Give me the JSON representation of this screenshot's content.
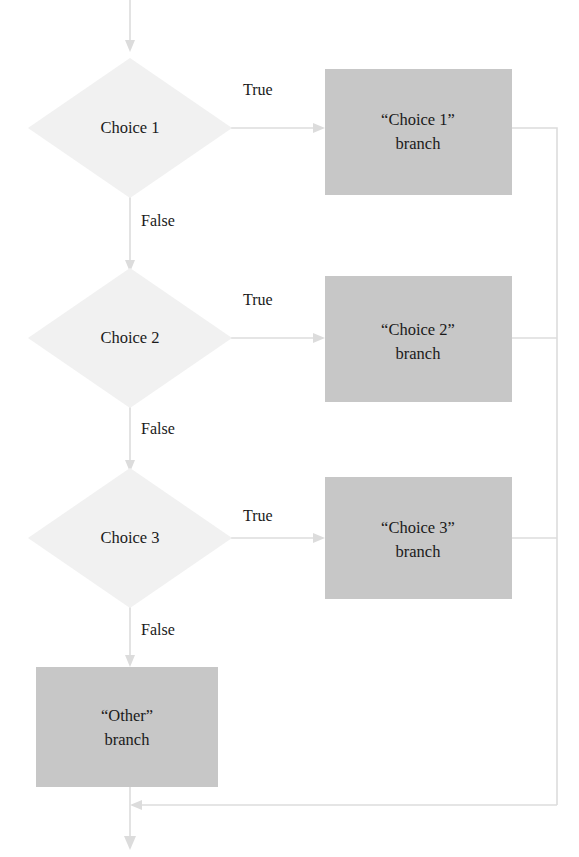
{
  "diagram": {
    "kind": "flowchart",
    "colors": {
      "background": "#ffffff",
      "decision_fill": "#f1f1f1",
      "process_fill": "#c7c7c7",
      "connector": "#dcdcdc",
      "text": "#1a1a1a"
    },
    "decisions": [
      {
        "id": "choice-1",
        "label": "Choice 1",
        "true_label": "True",
        "false_label": "False"
      },
      {
        "id": "choice-2",
        "label": "Choice 2",
        "true_label": "True",
        "false_label": "False"
      },
      {
        "id": "choice-3",
        "label": "Choice 3",
        "true_label": "True",
        "false_label": "False"
      }
    ],
    "processes": [
      {
        "id": "branch-1",
        "line1": "“Choice 1”",
        "line2": "branch"
      },
      {
        "id": "branch-2",
        "line1": "“Choice 2”",
        "line2": "branch"
      },
      {
        "id": "branch-3",
        "line1": "“Choice 3”",
        "line2": "branch"
      },
      {
        "id": "branch-other",
        "line1": "“Other”",
        "line2": "branch"
      }
    ]
  }
}
